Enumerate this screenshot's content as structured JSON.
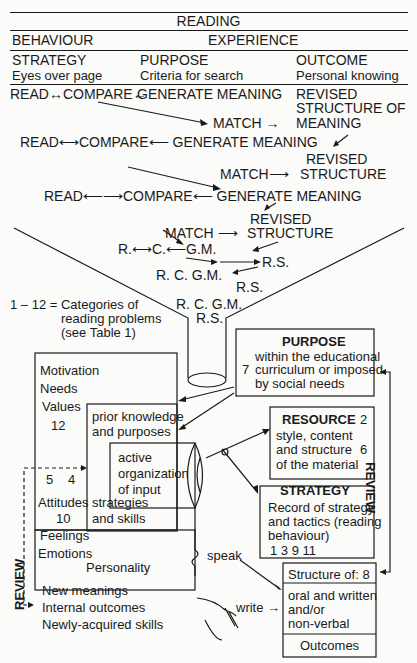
{
  "header": {
    "title": "READING",
    "behaviour": "BEHAVIOUR",
    "experience": "EXPERIENCE",
    "columns": [
      {
        "label": "STRATEGY",
        "sub": "Eyes over page"
      },
      {
        "label": "PURPOSE",
        "sub": "Criteria for search"
      },
      {
        "label": "OUTCOME",
        "sub": "Personal knowing"
      }
    ]
  },
  "cycle1": {
    "read_compare": "READ↔COMPARE←",
    "generate": "GENERATE MEANING",
    "revised1": "REVISED",
    "revised2": "STRUCTURE OF",
    "match": "MATCH →",
    "meaning": "MEANING"
  },
  "cycle2": {
    "read": "READ⟷COMPARE⟵ GENERATE MEANING",
    "revised": "REVISED",
    "match": "MATCH⟶",
    "structure": "STRUCTURE"
  },
  "cycle3": {
    "read": "READ⟵⟶COMPARE⟵ GENERATE MEANING",
    "revised": "REVISED",
    "match": "MATCH ⟶",
    "structure": "STRUCTURE"
  },
  "cycle4": {
    "row1": "R.⟷C.⟵G.M.",
    "rs1": "R.S.",
    "row2": "R.   C.  G.M.",
    "rs2": "R.S."
  },
  "cycle5": {
    "row1": "R. C. G.M.",
    "rs": "R.S."
  },
  "legend": {
    "line1": "1 – 12 = Categories of",
    "line2": "reading problems",
    "line3": "(see Table 1)"
  },
  "left_box": {
    "motivation": "Motivation",
    "needs": "Needs",
    "values": "Values",
    "n12": "12",
    "n5": "5",
    "n4": "4",
    "attitudes": "Attitudes",
    "n10": "10",
    "feelings": "Feelings",
    "emotions": "Emotions",
    "personality": "Personality"
  },
  "prior_box": {
    "line1": "prior knowledge",
    "line2": "and purposes",
    "line3": "strategies",
    "line4": "and skills"
  },
  "active_box": {
    "line1": "active",
    "line2": "organization",
    "line3": "of input"
  },
  "outcomes_box": {
    "line1": "New meanings",
    "line2": "Internal outcomes",
    "line3": "Newly-acquired skills"
  },
  "purpose_box": {
    "title": "PURPOSE",
    "num": "7",
    "line1": "within the educational",
    "line2": "curriculum or imposed",
    "line3": "by social needs"
  },
  "resource_box": {
    "title": "RESOURCE",
    "num1": "2",
    "line1": "style, content",
    "line2": "and structure",
    "num2": "6",
    "line3": "of the material"
  },
  "strategy_box": {
    "title": "STRATEGY",
    "line1": "Record of strategy",
    "line2": "and tactics (reading",
    "line3": "behaviour)",
    "nums": "1   3   9  11"
  },
  "structure_box": {
    "title": "Structure of:  8",
    "line1": "oral and written",
    "line2": "and/or",
    "line3": "non-verbal",
    "footer": "Outcomes"
  },
  "labels": {
    "speak": "speak",
    "write": "write →",
    "review_right": "REVIEW",
    "review_left": "REVIEW"
  }
}
